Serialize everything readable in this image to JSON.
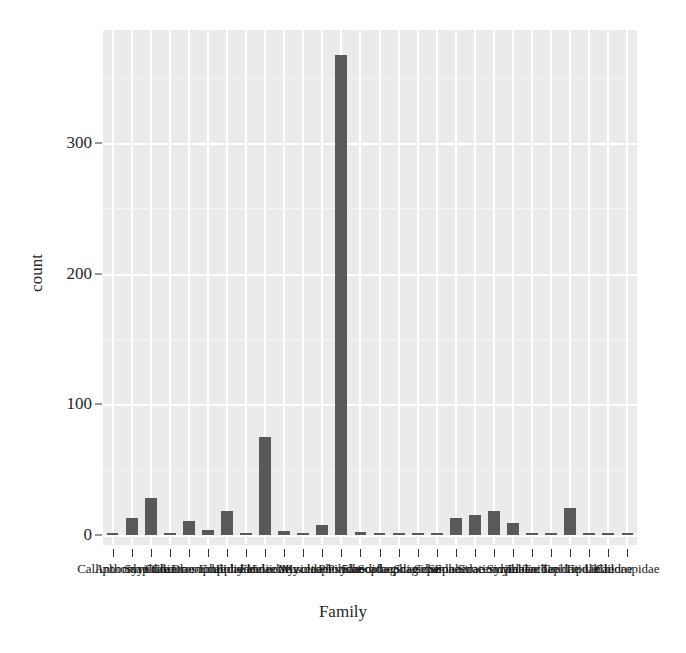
{
  "chart_data": {
    "type": "bar",
    "title": "",
    "subtitle": "",
    "xlabel": "Family",
    "ylabel": "count",
    "ylim": [
      0,
      380
    ],
    "yticks": [
      0,
      100,
      200,
      300
    ],
    "ytick_labels": [
      "0",
      "100",
      "200",
      "300"
    ],
    "grid": true,
    "legend": "none",
    "note": "x-axis category labels are rendered overlapping and illegible in the source image; they are serif text crowded along the axis",
    "categories": [
      "Calliphoridae",
      "Anthomyiidae",
      "Syrphidae",
      "Culicidae",
      "Chironomidae",
      "Drosophilidae",
      "Empididae",
      "Ephydridae",
      "Fanniidae",
      "Heleomyzidae",
      "Muscidae",
      "Mycetophilidae",
      "Phoridae",
      "Psychodidae",
      "Sarcophagidae",
      "Scathophagidae",
      "Sciaridae",
      "Sepsidae",
      "Simuliidae",
      "Sphaeroceridae",
      "Stratiomyidae",
      "Syrphidae",
      "Tabanidae",
      "Tachinidae",
      "Tephritidae",
      "Tipulidae",
      "Ulidiidae",
      "Chloropidae"
    ],
    "values": [
      1,
      13,
      28,
      1,
      11,
      4,
      18,
      1,
      75,
      3,
      1,
      8,
      367,
      2,
      1,
      1,
      1,
      1,
      13,
      15,
      18,
      9,
      1,
      1,
      21,
      1,
      1,
      1
    ],
    "bar_color": "#595959",
    "panel_color": "#ebebeb",
    "gridline_color": "#ffffff",
    "text_color": "#262626"
  }
}
